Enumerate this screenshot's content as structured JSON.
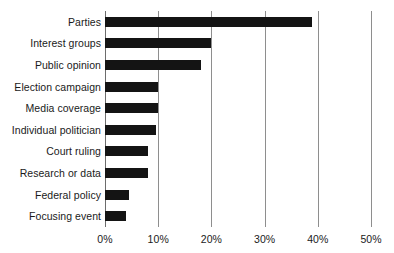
{
  "chart_data": {
    "type": "bar",
    "orientation": "horizontal",
    "title": "",
    "subtitle": "",
    "xlabel": "",
    "ylabel": "",
    "xlim": [
      0,
      50
    ],
    "xtick_labels": [
      "0%",
      "10%",
      "20%",
      "30%",
      "40%",
      "50%"
    ],
    "xtick_values": [
      0,
      10,
      20,
      30,
      40,
      50
    ],
    "grid": "vertical",
    "legend": "none",
    "value_suffix": "%",
    "categories": [
      "Parties",
      "Interest groups",
      "Public opinion",
      "Election campaign",
      "Media coverage",
      "Individual politician",
      "Court ruling",
      "Research or data",
      "Federal policy",
      "Focusing event"
    ],
    "values": [
      39,
      20,
      18,
      10,
      10,
      9.5,
      8,
      8,
      4.5,
      4
    ],
    "series": [
      {
        "name": "share",
        "values": [
          39,
          20,
          18,
          10,
          10,
          9.5,
          8,
          8,
          4.5,
          4
        ]
      }
    ],
    "colors": {
      "bar": "#141414",
      "gridline": "#8e8e8e",
      "axis": "#6d6d6d",
      "text": "#1a1a1a",
      "background": "#ffffff"
    }
  }
}
